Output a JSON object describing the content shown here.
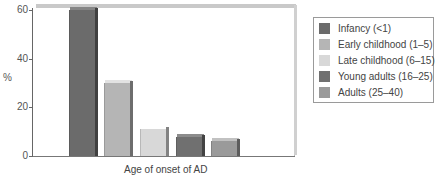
{
  "chart_data": {
    "type": "bar",
    "title": "",
    "xlabel": "Age of onset of AD",
    "ylabel": "%",
    "ylim": [
      0,
      60
    ],
    "yticks": [
      0,
      20,
      40,
      60
    ],
    "grid": false,
    "legend_position": "right",
    "categories": [
      "Infancy (<1)",
      "Early childhood (1–5)",
      "Late childhood (6–15)",
      "Young adults (16–25)",
      "Adults (25–40)"
    ],
    "values": [
      60,
      30,
      11,
      8,
      6
    ],
    "colors": [
      "#6b6b6b",
      "#b5b5b5",
      "#d8d8d8",
      "#707070",
      "#9a9a9a"
    ]
  },
  "axis": {
    "y_ticks": [
      "0",
      "20",
      "40",
      "60"
    ],
    "y_label": "%",
    "x_label": "Age of onset of AD"
  },
  "legend": {
    "items": [
      {
        "label": "Infancy (<1)",
        "color": "#6b6b6b"
      },
      {
        "label": "Early childhood (1–5)",
        "color": "#b5b5b5"
      },
      {
        "label": "Late childhood (6–15)",
        "color": "#d8d8d8"
      },
      {
        "label": "Young adults (16–25)",
        "color": "#707070"
      },
      {
        "label": "Adults (25–40)",
        "color": "#9a9a9a"
      }
    ]
  }
}
